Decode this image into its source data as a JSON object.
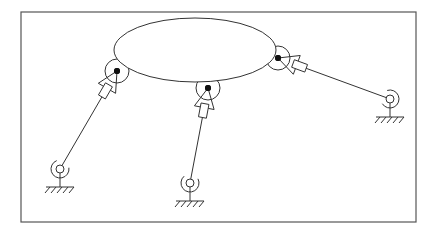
{
  "diagram": {
    "title": "",
    "colors": {
      "stroke": "#333333",
      "frame": "#555555",
      "joint_dot": "#111111",
      "background": "#ffffff"
    },
    "frame": {
      "x": 21,
      "y": 12,
      "width": 395,
      "height": 210
    },
    "platform": {
      "shape": "ellipse",
      "cx": 195,
      "cy": 50,
      "rx": 81,
      "ry": 32
    },
    "legs": [
      {
        "name": "left",
        "platform_joint": {
          "x": 117,
          "y": 71
        },
        "base_joint": {
          "x": 60,
          "y": 169
        }
      },
      {
        "name": "middle",
        "platform_joint": {
          "x": 208,
          "y": 88
        },
        "base_joint": {
          "x": 190,
          "y": 183
        }
      },
      {
        "name": "right",
        "platform_joint": {
          "x": 278,
          "y": 58
        },
        "base_joint": {
          "x": 390,
          "y": 99
        }
      }
    ],
    "labels": []
  }
}
